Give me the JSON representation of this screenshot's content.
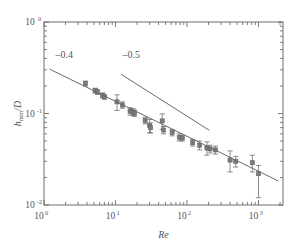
{
  "figure": {
    "background": "#ffffff",
    "axis_color": "#6e6e6e",
    "marker_color": "#7a7a7a",
    "line_color": "#6a6a6a",
    "text_color": "#555555"
  },
  "chart_data": {
    "type": "scatter",
    "title": "",
    "xlabel": "Re",
    "ylabel": "h_min /D",
    "ylabel_base": "h",
    "ylabel_sub": "min",
    "ylabel_tail": "/D",
    "xscale": "log",
    "yscale": "log",
    "xlim": [
      1,
      2200
    ],
    "ylim": [
      0.01,
      1
    ],
    "grid": false,
    "legend": null,
    "xticks": [
      {
        "value": 1,
        "mantissa": "10",
        "exponent": "0"
      },
      {
        "value": 10,
        "mantissa": "10",
        "exponent": "1"
      },
      {
        "value": 100,
        "mantissa": "10",
        "exponent": "2"
      },
      {
        "value": 1000,
        "mantissa": "10",
        "exponent": "3"
      }
    ],
    "yticks": [
      {
        "value": 1,
        "mantissa": "10",
        "exponent": "0"
      },
      {
        "value": 0.1,
        "mantissa": "10",
        "exponent": "-1"
      },
      {
        "value": 0.01,
        "mantissa": "10",
        "exponent": "-2"
      }
    ],
    "series": [
      {
        "name": "h_min/D measurements",
        "marker": "square",
        "color": "#7a7a7a",
        "points": [
          {
            "x": 3.8,
            "y": 0.213,
            "yerr_lo": 0.013,
            "yerr_hi": 0.013
          },
          {
            "x": 5.2,
            "y": 0.178,
            "yerr_lo": 0.011,
            "yerr_hi": 0.011
          },
          {
            "x": 5.6,
            "y": 0.172,
            "yerr_lo": 0.01,
            "yerr_hi": 0.01
          },
          {
            "x": 6.6,
            "y": 0.158,
            "yerr_lo": 0.01,
            "yerr_hi": 0.01
          },
          {
            "x": 7.0,
            "y": 0.152,
            "yerr_lo": 0.009,
            "yerr_hi": 0.009
          },
          {
            "x": 10.5,
            "y": 0.134,
            "yerr_lo": 0.026,
            "yerr_hi": 0.026
          },
          {
            "x": 12.5,
            "y": 0.124,
            "yerr_lo": 0.01,
            "yerr_hi": 0.01
          },
          {
            "x": 16.0,
            "y": 0.106,
            "yerr_lo": 0.01,
            "yerr_hi": 0.01
          },
          {
            "x": 17.5,
            "y": 0.104,
            "yerr_lo": 0.009,
            "yerr_hi": 0.009
          },
          {
            "x": 18.5,
            "y": 0.101,
            "yerr_lo": 0.008,
            "yerr_hi": 0.008
          },
          {
            "x": 26.0,
            "y": 0.084,
            "yerr_lo": 0.007,
            "yerr_hi": 0.007
          },
          {
            "x": 30.0,
            "y": 0.074,
            "yerr_lo": 0.012,
            "yerr_hi": 0.012
          },
          {
            "x": 31.0,
            "y": 0.07,
            "yerr_lo": 0.009,
            "yerr_hi": 0.009
          },
          {
            "x": 45.0,
            "y": 0.083,
            "yerr_lo": 0.016,
            "yerr_hi": 0.016
          },
          {
            "x": 47.0,
            "y": 0.066,
            "yerr_lo": 0.006,
            "yerr_hi": 0.006
          },
          {
            "x": 62.0,
            "y": 0.062,
            "yerr_lo": 0.005,
            "yerr_hi": 0.005
          },
          {
            "x": 78.0,
            "y": 0.055,
            "yerr_lo": 0.005,
            "yerr_hi": 0.005
          },
          {
            "x": 86.0,
            "y": 0.054,
            "yerr_lo": 0.004,
            "yerr_hi": 0.004
          },
          {
            "x": 120.0,
            "y": 0.048,
            "yerr_lo": 0.004,
            "yerr_hi": 0.004
          },
          {
            "x": 150.0,
            "y": 0.045,
            "yerr_lo": 0.005,
            "yerr_hi": 0.005
          },
          {
            "x": 190.0,
            "y": 0.042,
            "yerr_lo": 0.007,
            "yerr_hi": 0.007
          },
          {
            "x": 210.0,
            "y": 0.041,
            "yerr_lo": 0.004,
            "yerr_hi": 0.004
          },
          {
            "x": 250.0,
            "y": 0.04,
            "yerr_lo": 0.004,
            "yerr_hi": 0.004
          },
          {
            "x": 400.0,
            "y": 0.031,
            "yerr_lo": 0.008,
            "yerr_hi": 0.008
          },
          {
            "x": 480.0,
            "y": 0.03,
            "yerr_lo": 0.004,
            "yerr_hi": 0.004
          },
          {
            "x": 820.0,
            "y": 0.029,
            "yerr_lo": 0.006,
            "yerr_hi": 0.006
          },
          {
            "x": 1000.0,
            "y": 0.022,
            "yerr_lo": 0.01,
            "yerr_hi": 0.005
          }
        ]
      }
    ],
    "annotations": [
      {
        "id": "slope-fit",
        "label": "–0.4",
        "slope": -0.4,
        "label_x": 1.45,
        "label_y": 0.4,
        "line_x0": 1.2,
        "line_y0": 0.305,
        "line_x1": 1900,
        "line_y1": 0.0183,
        "role": "power-law fit through data"
      },
      {
        "id": "slope-reference",
        "label": "–0.5",
        "slope": -0.5,
        "label_x": 12.5,
        "label_y": 0.4,
        "line_x0": 12.0,
        "line_y0": 0.268,
        "line_x1": 205.0,
        "line_y1": 0.0655,
        "role": "reference guide line"
      }
    ]
  }
}
